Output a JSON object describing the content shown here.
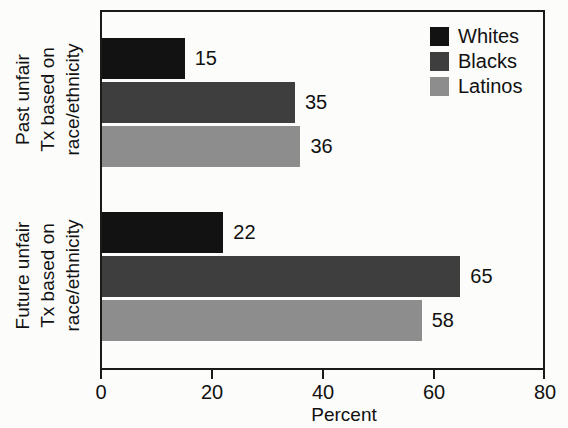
{
  "chart_data": {
    "type": "bar",
    "orientation": "horizontal",
    "title": "",
    "xlabel": "Percent",
    "ylabel": "",
    "xlim": [
      0,
      80
    ],
    "xticks": [
      0,
      20,
      40,
      60,
      80
    ],
    "xtick_labels": [
      "0",
      "20",
      "40",
      "60",
      "80"
    ],
    "grid": false,
    "legend_position": "top-right",
    "categories": [
      "Past unfair\nTx based on\nrace/ethnicity",
      "Future unfair\nTx based on\nrace/ethnicity"
    ],
    "series": [
      {
        "name": "Whites",
        "color": "#121212",
        "values": [
          15,
          22
        ]
      },
      {
        "name": "Blacks",
        "color": "#3e3e3e",
        "values": [
          35,
          65
        ]
      },
      {
        "name": "Latinos",
        "color": "#8d8d8d",
        "values": [
          36,
          58
        ]
      }
    ],
    "data_labels": {
      "past": {
        "whites": "15",
        "blacks": "35",
        "latinos": "36"
      },
      "future": {
        "whites": "22",
        "blacks": "65",
        "latinos": "58"
      }
    }
  },
  "legend": {
    "items": [
      {
        "label": "Whites",
        "color": "#121212"
      },
      {
        "label": "Blacks",
        "color": "#3e3e3e"
      },
      {
        "label": "Latinos",
        "color": "#8d8d8d"
      }
    ]
  },
  "axes": {
    "x_title": "Percent",
    "x_ticks": [
      "0",
      "20",
      "40",
      "60",
      "80"
    ],
    "category_past": "Past unfair\nTx based on\nrace/ethnicity",
    "category_future": "Future unfair\nTx based on\nrace/ethnicity"
  }
}
